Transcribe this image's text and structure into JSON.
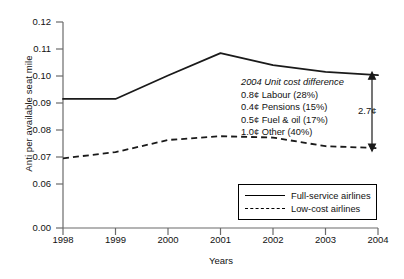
{
  "chart_data": {
    "type": "line",
    "title": "",
    "xlabel": "Years",
    "ylabel": "Anti per available seat mile",
    "categories": [
      "1998",
      "1999",
      "2000",
      "2001",
      "2002",
      "2003",
      "2004"
    ],
    "x": [
      1998,
      1999,
      2000,
      2001,
      2002,
      2003,
      2004
    ],
    "xlim": [
      1998,
      2004
    ],
    "ylim": [
      0.06,
      0.12
    ],
    "yticks": [
      "0.12",
      "0.11",
      "0.10",
      "0.09",
      "0.08",
      "0.07",
      "0.06",
      "0.00"
    ],
    "ytick_values": [
      0.12,
      0.11,
      0.1,
      0.09,
      0.08,
      0.07,
      0.06,
      0.0
    ],
    "grid": false,
    "legend_position": "bottom-right",
    "series": [
      {
        "name": "Full-service airlines",
        "style": "solid",
        "color": "#000000",
        "values": [
          0.0915,
          0.0915,
          0.1002,
          0.1085,
          0.104,
          0.1015,
          0.1003
        ]
      },
      {
        "name": "Low-cost airlines",
        "style": "dashed",
        "color": "#000000",
        "values": [
          0.0695,
          0.0718,
          0.0763,
          0.0777,
          0.0772,
          0.074,
          0.0733
        ]
      }
    ],
    "annotations": [
      {
        "name": "unit-cost-difference",
        "head": "2004 Unit cost difference",
        "lines": [
          "0.8¢ Labour (28%)",
          "0.4¢ Pensions (15%)",
          "0.5¢ Fuel & oil (17%)",
          "1.0¢ Other (40%)"
        ]
      },
      {
        "name": "difference-arrow",
        "label": "2.7¢"
      }
    ]
  },
  "axes": {
    "ylabel": "Anti per available seat mile",
    "xlabel": "Years",
    "yticks": [
      "0.12",
      "0.11",
      "0.10",
      "0.09",
      "0.08",
      "0.07",
      "0.06",
      "0.00"
    ],
    "xticks": [
      "1998",
      "1999",
      "2000",
      "2001",
      "2002",
      "2003",
      "2004"
    ]
  },
  "annotation": {
    "head": "2004 Unit cost difference",
    "line1": "0.8¢ Labour (28%)",
    "line2": "0.4¢ Pensions (15%)",
    "line3": "0.5¢ Fuel & oil (17%)",
    "line4": "1.0¢ Other (40%)",
    "diff_label": "2.7¢"
  },
  "legend": {
    "items": [
      {
        "label": "Full-service airlines",
        "style": "solid"
      },
      {
        "label": "Low-cost airlines",
        "style": "dashed"
      }
    ]
  },
  "colors": {
    "line": "#000000",
    "axis": "#6b6b6b",
    "text": "#111111",
    "background": "#ffffff"
  }
}
